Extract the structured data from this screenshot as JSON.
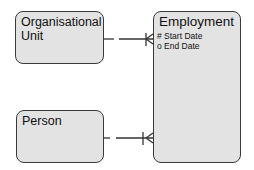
{
  "diagram": {
    "type": "entity-relationship",
    "entities": [
      {
        "id": "organisational-unit",
        "title_line1": "Organisational",
        "title_line2": "Unit",
        "attributes": []
      },
      {
        "id": "employment",
        "title": "Employment",
        "attributes": [
          "# Start Date",
          "o End Date"
        ]
      },
      {
        "id": "person",
        "title": "Person",
        "attributes": []
      }
    ],
    "relationships": [
      {
        "from": "organisational-unit",
        "to": "employment",
        "from_end": "optional (dashed)",
        "to_end": "mandatory-one-or-many (crow's foot)"
      },
      {
        "from": "person",
        "to": "employment",
        "from_end": "optional (dashed)",
        "to_end": "mandatory-one-or-many (crow's foot)"
      }
    ]
  },
  "colors": {
    "entity_fill": "#e3e3e3",
    "entity_border": "#3a3a3a",
    "line": "#333333",
    "background": "#ffffff"
  }
}
